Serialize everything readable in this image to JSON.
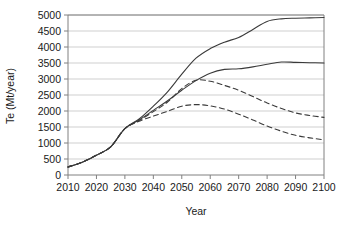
{
  "chart_data": {
    "type": "line",
    "title": "",
    "xlabel": "Year",
    "ylabel": "Te (Mt/year)",
    "xlim": [
      2010,
      2100
    ],
    "ylim": [
      0,
      5000
    ],
    "xticks": [
      2010,
      2020,
      2030,
      2040,
      2050,
      2060,
      2070,
      2080,
      2090,
      2100
    ],
    "yticks": [
      0,
      500,
      1000,
      1500,
      2000,
      2500,
      3000,
      3500,
      4000,
      4500,
      5000
    ],
    "grid": "horizontal",
    "legend": "none",
    "line_color": "#3a3a3a",
    "grid_color": "#c9c9c9",
    "axis_color": "#808080",
    "x": [
      2010,
      2015,
      2020,
      2025,
      2030,
      2035,
      2040,
      2045,
      2050,
      2055,
      2060,
      2065,
      2070,
      2075,
      2080,
      2085,
      2090,
      2095,
      2100
    ],
    "series": [
      {
        "name": "upper-solid",
        "style": "solid",
        "values": [
          250,
          400,
          620,
          880,
          1450,
          1750,
          2150,
          2600,
          3150,
          3650,
          3950,
          4150,
          4300,
          4550,
          4800,
          4880,
          4900,
          4910,
          4920
        ]
      },
      {
        "name": "middle-solid",
        "style": "solid",
        "values": [
          250,
          400,
          620,
          880,
          1450,
          1720,
          2020,
          2320,
          2650,
          2950,
          3180,
          3300,
          3320,
          3380,
          3460,
          3530,
          3520,
          3510,
          3500
        ]
      },
      {
        "name": "upper-dashed",
        "style": "dashed",
        "values": [
          250,
          400,
          620,
          880,
          1450,
          1700,
          1980,
          2280,
          2700,
          2960,
          2930,
          2800,
          2650,
          2450,
          2250,
          2080,
          1940,
          1860,
          1800
        ]
      },
      {
        "name": "lower-dashed",
        "style": "dashed",
        "values": [
          250,
          400,
          620,
          880,
          1450,
          1680,
          1840,
          1990,
          2150,
          2200,
          2160,
          2060,
          1900,
          1720,
          1530,
          1370,
          1240,
          1160,
          1100
        ]
      }
    ]
  }
}
